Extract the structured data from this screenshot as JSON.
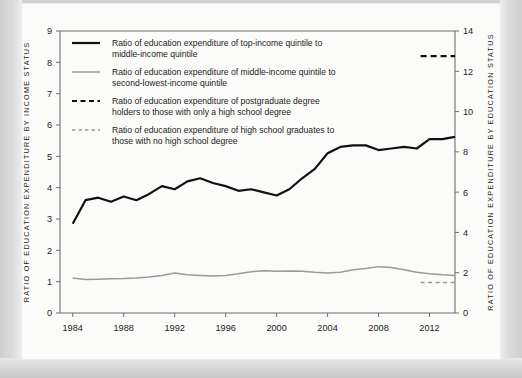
{
  "chart_data": {
    "type": "line",
    "title": "",
    "xlabel": "",
    "ylabel": "RATIO OF EDUCATION EXPENDITURE BY INCOME STATUS",
    "y2label": "RATIO OF EDUCATION EXPENDITURE BY EDUCATION STATUS",
    "grid": false,
    "legend_position": "top-left inside plot",
    "xlim": [
      1983,
      2014
    ],
    "ylim": [
      0,
      9
    ],
    "y2lim": [
      0,
      14
    ],
    "xticks": [
      1984,
      1988,
      1992,
      1996,
      2000,
      2004,
      2008,
      2012
    ],
    "yticks": [
      0,
      1,
      2,
      3,
      4,
      5,
      6,
      7,
      8,
      9
    ],
    "y2ticks": [
      0,
      2,
      4,
      6,
      8,
      10,
      12,
      14
    ],
    "x": [
      1984,
      1985,
      1986,
      1987,
      1988,
      1989,
      1990,
      1991,
      1992,
      1993,
      1994,
      1995,
      1996,
      1997,
      1998,
      1999,
      2000,
      2001,
      2002,
      2003,
      2004,
      2005,
      2006,
      2007,
      2008,
      2009,
      2010,
      2011,
      2012,
      2013,
      2014
    ],
    "series": [
      {
        "name": "Ratio of education expenditure of top-income quintile to middle-income quintile",
        "axis": "left",
        "style": "solid",
        "color": "#111111",
        "width": 2.2,
        "values": [
          2.85,
          3.6,
          3.68,
          3.55,
          3.72,
          3.6,
          3.8,
          4.05,
          3.95,
          4.2,
          4.3,
          4.15,
          4.05,
          3.9,
          3.95,
          3.85,
          3.75,
          3.95,
          4.3,
          4.6,
          5.1,
          5.3,
          5.35,
          5.35,
          5.2,
          5.25,
          5.3,
          5.25,
          5.55,
          5.55,
          5.62
        ]
      },
      {
        "name": "Ratio of education expenditure of middle-income quintile to second-lowest-income quintile",
        "axis": "left",
        "style": "solid",
        "color": "#9a9a9a",
        "width": 1.5,
        "values": [
          1.12,
          1.07,
          1.08,
          1.09,
          1.1,
          1.12,
          1.15,
          1.2,
          1.28,
          1.22,
          1.2,
          1.18,
          1.2,
          1.25,
          1.32,
          1.35,
          1.33,
          1.34,
          1.33,
          1.3,
          1.28,
          1.3,
          1.38,
          1.42,
          1.48,
          1.45,
          1.38,
          1.3,
          1.25,
          1.22,
          1.2
        ]
      },
      {
        "name": "Ratio of education expenditure of postgraduate degree holders to those with only a high school degree",
        "axis": "right",
        "style": "dashed",
        "color": "#111111",
        "width": 2.2,
        "x": [
          2011.3,
          2014
        ],
        "values": [
          12.75,
          12.75
        ]
      },
      {
        "name": "Ratio of education expenditure of high school graduates to those with no high school degree",
        "axis": "right",
        "style": "dashed",
        "color": "#9a9a9a",
        "width": 1.5,
        "x": [
          2011.3,
          2014
        ],
        "values": [
          1.52,
          1.52
        ]
      }
    ]
  },
  "axes": {
    "left_title": "RATIO OF EDUCATION EXPENDITURE BY INCOME STATUS",
    "right_title": "RATIO OF EDUCATION EXPENDITURE BY EDUCATION STATUS",
    "left_ticks": [
      "9",
      "8",
      "7",
      "6",
      "5",
      "4",
      "3",
      "2",
      "1",
      "0"
    ],
    "right_ticks": [
      "14",
      "12",
      "10",
      "8",
      "6",
      "4",
      "2",
      "0"
    ],
    "x_ticks": [
      "1984",
      "1988",
      "1992",
      "1996",
      "2000",
      "2004",
      "2008",
      "2012"
    ]
  },
  "legend": {
    "items": [
      {
        "swatch": "solid-black",
        "line1": "Ratio of education expenditure of top-income quintile to",
        "line2": "middle-income quintile"
      },
      {
        "swatch": "solid-gray",
        "line1": "Ratio of education expenditure of middle-income quintile to",
        "line2": "second-lowest-income quintile"
      },
      {
        "swatch": "dashed-black",
        "line1": "Ratio of education expenditure of postgraduate degree",
        "line2": "holders to those with only a high school degree"
      },
      {
        "swatch": "dashed-gray",
        "line1": "Ratio of education expenditure of high school graduates to",
        "line2": "those with no high school degree"
      }
    ]
  },
  "colors": {
    "series_black": "#111111",
    "series_gray": "#9a9a9a",
    "axis": "#6e6e6e",
    "text": "#1b1b1b",
    "paper": "#fbfbfa",
    "page_edge": "#d9d9d9"
  }
}
